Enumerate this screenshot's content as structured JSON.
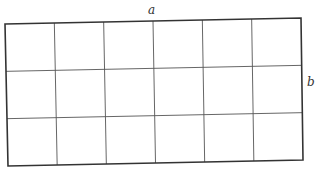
{
  "diagram": {
    "type": "rectangle-grid",
    "columns": 6,
    "rows": 3,
    "labels": {
      "top": "a",
      "right": "b"
    },
    "corners": {
      "top_left": [
        5,
        24
      ],
      "top_right": [
        301,
        18
      ],
      "bottom_right": [
        303,
        160
      ],
      "bottom_left": [
        8,
        166
      ]
    },
    "colors": {
      "border": "#333333",
      "grid": "#555555",
      "label": "#333333",
      "background": "#ffffff"
    }
  }
}
